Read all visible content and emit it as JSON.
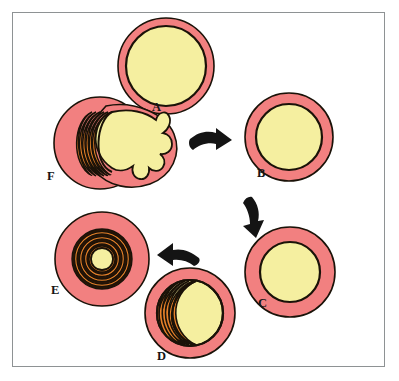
{
  "figure": {
    "border_color": "#8e9294",
    "background_color": "#ffffff"
  },
  "palette": {
    "rim_pink": "#F28080",
    "core_yellow": "#F5EFA0",
    "ridge_orange": "#E8822A",
    "outline_black": "#1a1208",
    "arrow_black": "#141414",
    "frame_gray": "#8e9294"
  },
  "stages": [
    {
      "id": "A",
      "label": "A",
      "name": "stage-a-relaxed",
      "caption": "Relaxed: thin pink rim, large yellow core",
      "cx": 166,
      "cy": 66,
      "outer_r": 48,
      "inner_r": 40,
      "ridges": 0,
      "core_r": 40
    },
    {
      "id": "B",
      "label": "B",
      "name": "stage-b-early-contraction",
      "caption": "Early contraction: rim thickens slightly",
      "cx": 289,
      "cy": 137,
      "outer_r": 44,
      "inner_r": 33,
      "ridges": 0,
      "core_r": 33
    },
    {
      "id": "C",
      "label": "C",
      "name": "stage-c-contraction",
      "caption": "Contraction: rim markedly thickened, core reduced",
      "cx": 290,
      "cy": 272,
      "outer_r": 45,
      "inner_r": 30,
      "ridges": 0,
      "core_r": 30
    },
    {
      "id": "D",
      "label": "D",
      "name": "stage-d-eccentric-infolding",
      "caption": "Eccentric infolding: concentric ridges crowd the left side, core displaced right",
      "cx": 190,
      "cy": 313,
      "outer_r": 45,
      "inner_r": 33,
      "ridges": 7,
      "core_r": 33
    },
    {
      "id": "E",
      "label": "E",
      "name": "stage-e-concentric-infolding",
      "caption": "Concentric infolding: nested dark ridges surround a small yellow centre",
      "cx": 102,
      "cy": 259,
      "outer_r": 47,
      "inner_r": 30,
      "ridges": 8,
      "core_r": 12
    },
    {
      "id": "F",
      "label": "F",
      "name": "stage-f-rupture-extrusion",
      "caption": "Rupture: yellow mass extrudes through the wall as finger-like projections",
      "cx": 100,
      "cy": 143,
      "outer_r": 46,
      "inner_r": 34,
      "ridges": 6,
      "core_r": 34,
      "projection_count": 5
    }
  ],
  "arrows": [
    {
      "id": "arrow-a-to-b",
      "name": "flow-arrow-a-to-b",
      "from": "A",
      "to": "B",
      "direction": "right"
    },
    {
      "id": "arrow-b-to-c",
      "name": "flow-arrow-b-to-c",
      "from": "B",
      "to": "C",
      "direction": "down"
    },
    {
      "id": "arrow-d-to-e",
      "name": "flow-arrow-d-to-e",
      "from": "D",
      "to": "E",
      "direction": "up-left"
    }
  ]
}
